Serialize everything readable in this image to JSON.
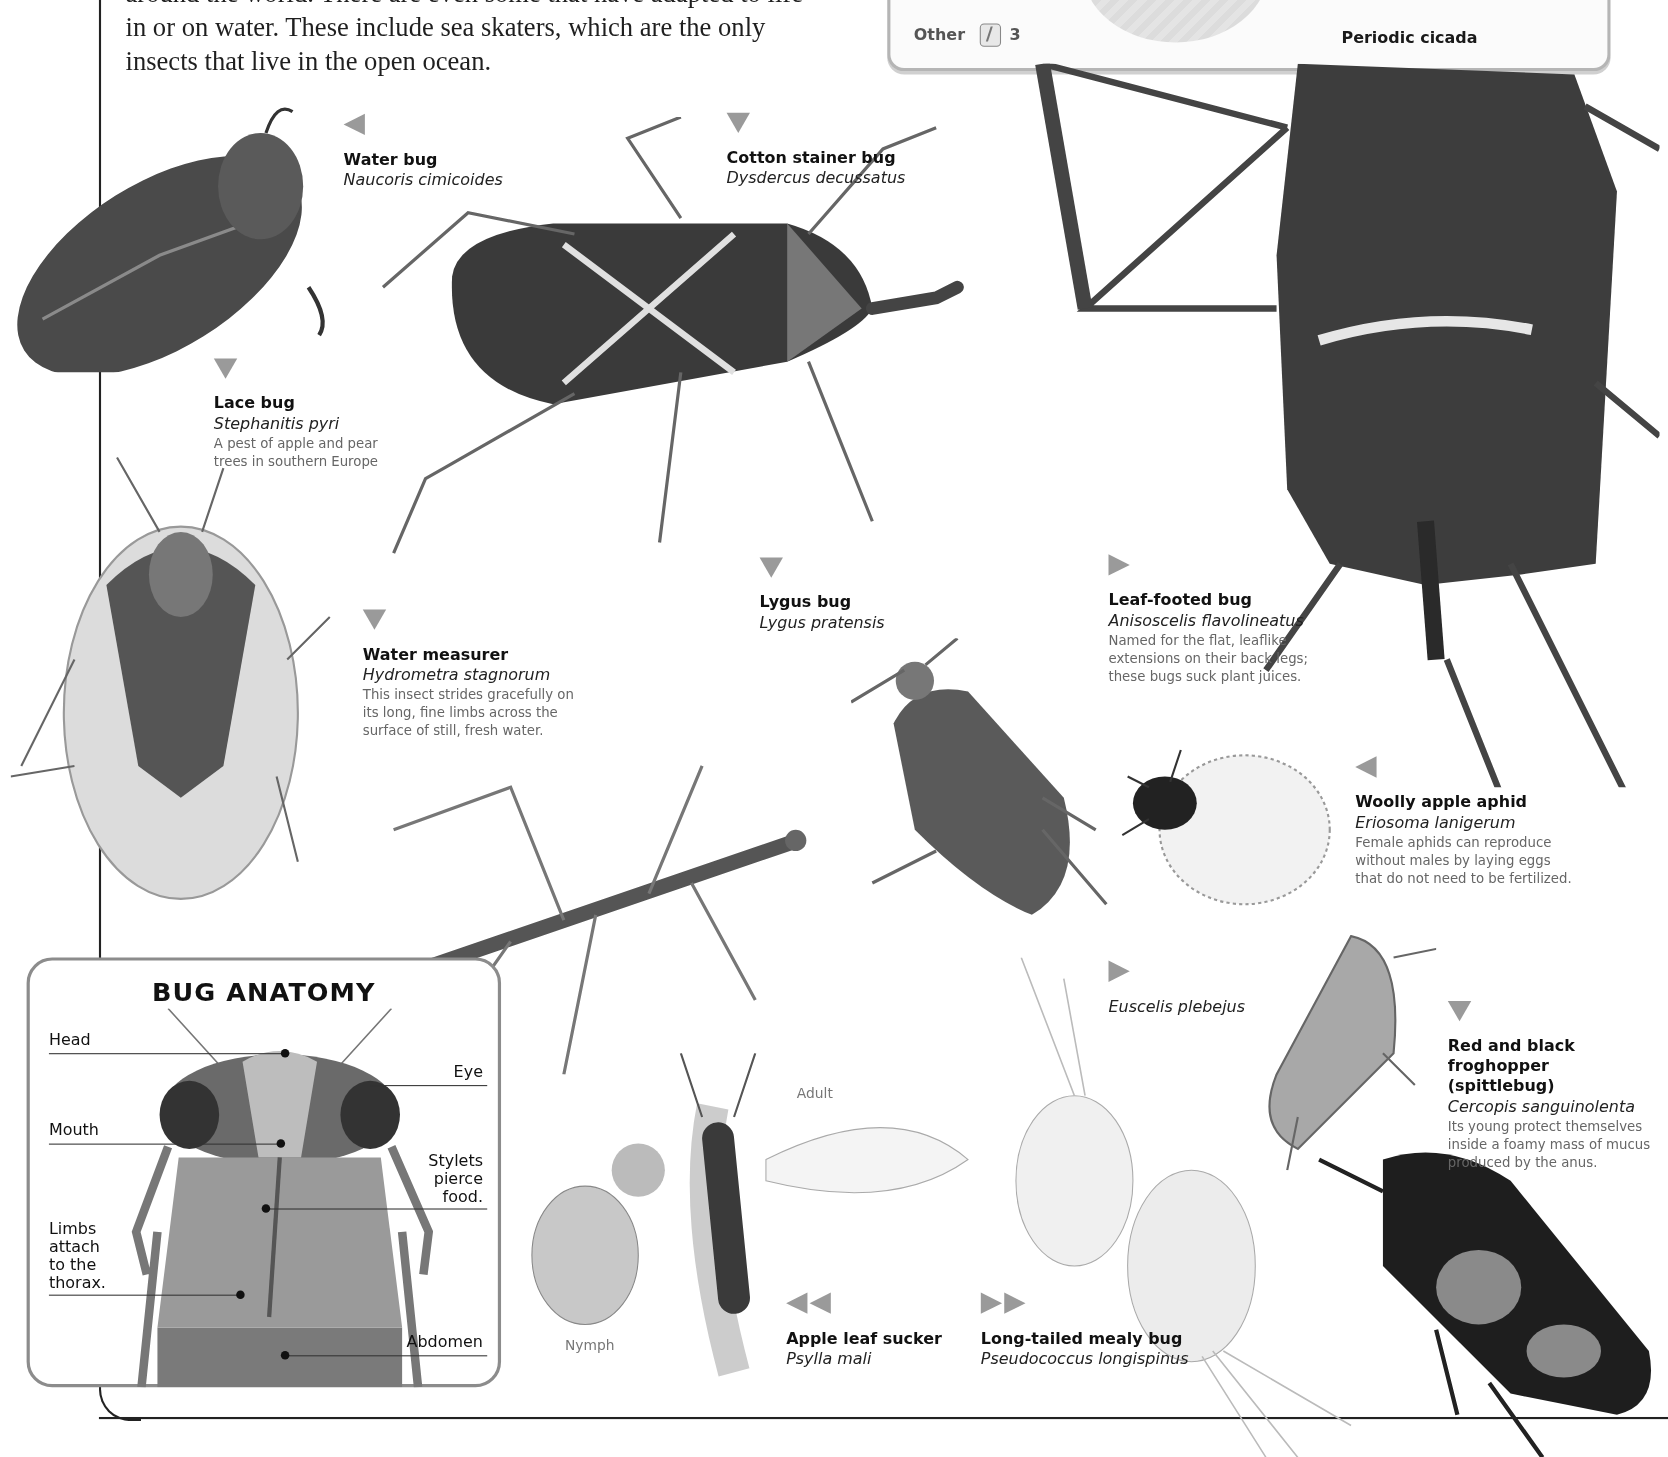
{
  "intro": {
    "lines": [
      "around the world. There are even some that have adapted to life",
      "in or on water. These include sea skaters, which are the only",
      "insects that live in the open ocean."
    ]
  },
  "infobox": {
    "other_label": "Other",
    "other_icon": "insect-group-icon",
    "other_count": "3",
    "cicada_label": "Periodic cicada"
  },
  "captions": {
    "water_bug": {
      "name": "Water bug",
      "latin": "Naucoris cimicoides",
      "arrow": "left"
    },
    "cotton_stainer": {
      "name": "Cotton stainer bug",
      "latin": "Dysdercus decussatus",
      "arrow": "down"
    },
    "lace_bug": {
      "name": "Lace bug",
      "latin": "Stephanitis pyri",
      "desc": [
        "A pest of apple and pear",
        "trees in southern Europe"
      ],
      "arrow": "down"
    },
    "water_measurer": {
      "name": "Water measurer",
      "latin": "Hydrometra stagnorum",
      "desc": [
        "This insect strides gracefully on",
        "its long, fine limbs across the",
        "surface of still, fresh water."
      ],
      "arrow": "down"
    },
    "lygus_bug": {
      "name": "Lygus bug",
      "latin": "Lygus pratensis",
      "arrow": "down"
    },
    "leaf_footed": {
      "name": "Leaf-footed bug",
      "latin": "Anisoscelis flavolineatus",
      "desc": [
        "Named for the flat, leaflike",
        "extensions on their back legs;",
        "these bugs suck plant juices."
      ],
      "arrow": "right"
    },
    "woolly_aphid": {
      "name": "Woolly apple aphid",
      "latin": "Eriosoma lanigerum",
      "desc": [
        "Female aphids can reproduce",
        "without males by laying eggs",
        "that do not need to be fertilized."
      ],
      "arrow": "left"
    },
    "euscelis": {
      "latin": "Euscelis plebejus",
      "arrow": "right"
    },
    "froghopper": {
      "name_lines": [
        "Red and black froghopper",
        "(spittlebug)"
      ],
      "latin": "Cercopis sanguinolenta",
      "desc": [
        "Its young protect themselves",
        "inside a foamy mass of mucus",
        "produced by the anus."
      ],
      "arrow": "down"
    },
    "apple_leaf_sucker": {
      "name": "Apple leaf sucker",
      "latin": "Psylla mali",
      "arrow": "double-left",
      "adult_label": "Adult",
      "nymph_label": "Nymph"
    },
    "mealy_bug": {
      "name": "Long-tailed mealy bug",
      "latin": "Pseudococcus longispinus",
      "arrow": "double-right"
    }
  },
  "anatomy": {
    "title": "BUG ANATOMY",
    "labels": {
      "head": "Head",
      "eye": "Eye",
      "mouth": "Mouth",
      "stylets": [
        "Stylets",
        "pierce",
        "food."
      ],
      "limbs": [
        "Limbs",
        "attach",
        "to the",
        "thorax."
      ],
      "abdomen": "Abdomen"
    }
  },
  "colors": {
    "arrow": "#9a9a9a",
    "frame": "#222222",
    "box_border": "#8c8c8c",
    "caption_desc": "#666666"
  }
}
